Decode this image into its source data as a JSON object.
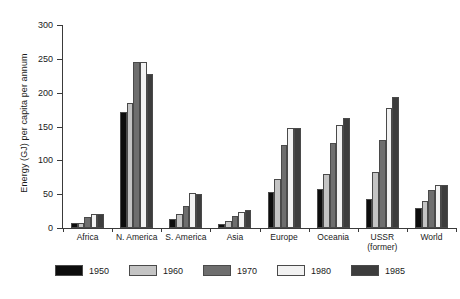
{
  "chart_data": {
    "type": "bar",
    "title": "",
    "subtitle": "",
    "xlabel": "",
    "ylabel": "Energy (GJ) per capita per annum",
    "ylim": [
      0,
      300
    ],
    "yticks": [
      0,
      50,
      100,
      150,
      200,
      250,
      300
    ],
    "ytick_labels": [
      "0",
      "50",
      "100",
      "150",
      "200",
      "250",
      "300"
    ],
    "grid": false,
    "legend_position": "bottom",
    "categories": [
      "Africa",
      "N. America",
      "S. America",
      "Asia",
      "Europe",
      "Oceania",
      "USSR\n(former)",
      "World"
    ],
    "category_labels": [
      [
        "Africa"
      ],
      [
        "N. America"
      ],
      [
        "S. America"
      ],
      [
        "Asia"
      ],
      [
        "Europe"
      ],
      [
        "Oceania"
      ],
      [
        "USSR",
        "(former)"
      ],
      [
        "World"
      ]
    ],
    "series": [
      {
        "name": "1950",
        "color": "#0d0d0d",
        "values": [
          7,
          172,
          13,
          6,
          53,
          58,
          43,
          29
        ]
      },
      {
        "name": "1960",
        "color": "#c4c4c4",
        "values": [
          8,
          185,
          20,
          11,
          72,
          80,
          83,
          40
        ]
      },
      {
        "name": "1970",
        "color": "#6e6e6e",
        "values": [
          17,
          245,
          33,
          18,
          122,
          125,
          130,
          56
        ]
      },
      {
        "name": "1980",
        "color": "#f2f2f2",
        "values": [
          21,
          245,
          52,
          23,
          148,
          152,
          178,
          63
        ]
      },
      {
        "name": "1985",
        "color": "#3d3d3d",
        "values": [
          21,
          227,
          51,
          27,
          148,
          162,
          193,
          63
        ]
      }
    ]
  },
  "legend": {
    "items": [
      {
        "label": "1950",
        "color": "#0d0d0d"
      },
      {
        "label": "1960",
        "color": "#c4c4c4"
      },
      {
        "label": "1970",
        "color": "#6e6e6e"
      },
      {
        "label": "1980",
        "color": "#f2f2f2"
      },
      {
        "label": "1985",
        "color": "#3d3d3d"
      }
    ]
  }
}
